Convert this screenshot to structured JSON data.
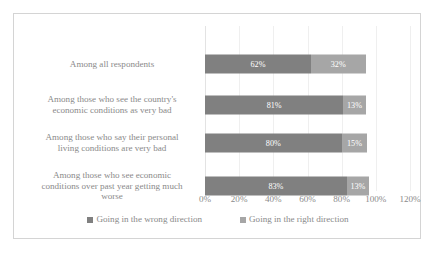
{
  "chart_data": {
    "type": "bar",
    "orientation": "horizontal",
    "stacked": true,
    "title": "",
    "xlabel": "",
    "ylabel": "",
    "xlim": [
      0,
      120
    ],
    "xticks": [
      "0%",
      "20%",
      "40%",
      "60%",
      "80%",
      "100%",
      "120%"
    ],
    "xtick_values": [
      0,
      20,
      40,
      60,
      80,
      100,
      120
    ],
    "grid": true,
    "legend_position": "bottom",
    "categories": [
      "Among all respondents",
      "Among those who see the country's economic conditions as very bad",
      "Among those who say their personal living conditions are very bad",
      "Among those who see economic conditions over past year getting much worse"
    ],
    "category_lines": [
      [
        "Among all respondents"
      ],
      [
        "Among those who see the country's",
        "economic conditions as very bad"
      ],
      [
        "Among those who say their personal",
        "living conditions are very bad"
      ],
      [
        "Among those who see economic",
        "conditions over past year getting much",
        "worse"
      ]
    ],
    "series": [
      {
        "name": "Going in the wrong direction",
        "color": "#808080",
        "values": [
          62,
          81,
          80,
          83
        ],
        "labels": [
          "62%",
          "81%",
          "80%",
          "83%"
        ]
      },
      {
        "name": "Going in the right direction",
        "color": "#a6a6a6",
        "values": [
          32,
          13,
          15,
          13
        ],
        "labels": [
          "32%",
          "13%",
          "15%",
          "13%"
        ]
      }
    ]
  },
  "legend": {
    "items": [
      {
        "label": "Going in the wrong direction",
        "color": "#808080"
      },
      {
        "label": "Going in the right direction",
        "color": "#a6a6a6"
      }
    ]
  },
  "colors": {
    "wrong_direction": "#808080",
    "right_direction": "#a6a6a6",
    "text": "#8a8a8a",
    "border": "#d4d4d4",
    "gridline": "#efefef",
    "background": "#ffffff"
  }
}
